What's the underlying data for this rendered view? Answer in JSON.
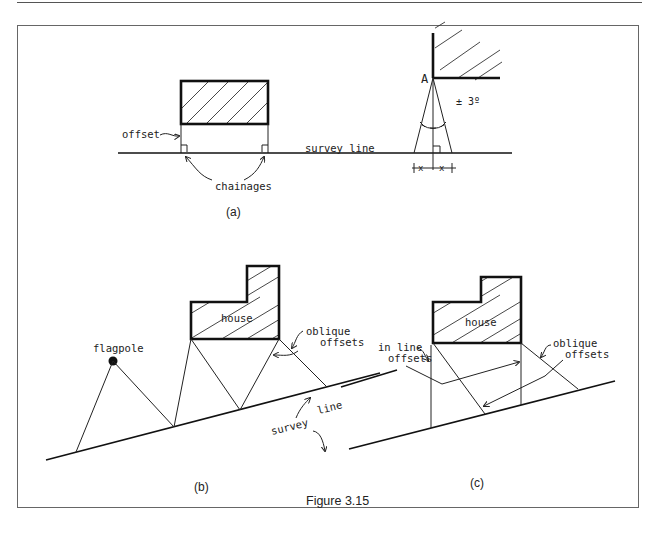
{
  "figure": {
    "caption": "Figure 3.15",
    "panels": {
      "a": {
        "label": "(a)",
        "texts": {
          "offset": "offset",
          "survey_line": "survey line",
          "chainages": "chainages",
          "point": "A",
          "angle": "± 3º",
          "x_left": "x",
          "x_right": "x"
        }
      },
      "b": {
        "label": "(b)",
        "texts": {
          "flagpole": "flagpole",
          "house": "house",
          "oblique_1": "oblique",
          "oblique_2": "offsets",
          "survey_1": "survey",
          "survey_2": "line"
        }
      },
      "c": {
        "label": "(c)",
        "texts": {
          "house": "house",
          "inline_1": "in line",
          "inline_2": "offsets",
          "oblique_1": "oblique",
          "oblique_2": "offsets"
        }
      }
    }
  }
}
